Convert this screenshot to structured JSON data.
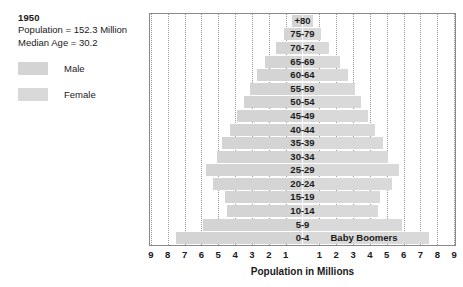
{
  "info": {
    "year": "1950",
    "population": "Population = 152.3 Million",
    "median_age": "Median Age = 30.2"
  },
  "legend": {
    "items": [
      {
        "label": "Male",
        "color": "#d4d4d4"
      },
      {
        "label": "Female",
        "color": "#d9d9d9"
      }
    ]
  },
  "axis": {
    "title": "Population in Millions",
    "left_ticks": [
      "9",
      "8",
      "7",
      "6",
      "5",
      "4",
      "3",
      "2",
      "1"
    ],
    "right_ticks": [
      "1",
      "2",
      "3",
      "4",
      "5",
      "6",
      "7",
      "8",
      "9"
    ],
    "max": 9,
    "grid": true
  },
  "annotations": [
    {
      "text": "Baby Boomers",
      "row": "0-4"
    }
  ],
  "chart_data": {
    "type": "bar",
    "subtype": "population-pyramid",
    "title": "1950",
    "xlabel": "Population in Millions",
    "ylabel": "",
    "xlim": [
      -9,
      9
    ],
    "grid": true,
    "legend_position": "left-outside",
    "categories": [
      "+80",
      "75-79",
      "70-74",
      "65-69",
      "60-64",
      "55-59",
      "50-54",
      "45-49",
      "40-44",
      "35-39",
      "30-34",
      "25-29",
      "20-24",
      "15-19",
      "10-14",
      "5-9",
      "0-4"
    ],
    "series": [
      {
        "name": "Male",
        "color": "#d4d4d4",
        "values": [
          0.6,
          1.1,
          1.6,
          2.2,
          2.7,
          3.1,
          3.5,
          3.9,
          4.3,
          4.8,
          5.1,
          5.7,
          5.3,
          4.6,
          4.5,
          5.9,
          7.5
        ]
      },
      {
        "name": "Female",
        "color": "#d9d9d9",
        "values": [
          0.6,
          1.1,
          1.6,
          2.2,
          2.7,
          3.1,
          3.5,
          3.9,
          4.3,
          4.8,
          5.1,
          5.7,
          5.3,
          4.6,
          4.5,
          5.9,
          7.5
        ]
      }
    ]
  }
}
